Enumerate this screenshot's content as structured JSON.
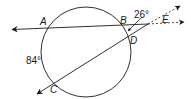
{
  "diagram": {
    "type": "circle-secants",
    "points": {
      "A": "A",
      "B": "B",
      "C": "C",
      "D": "D",
      "E": "E"
    },
    "angles": {
      "arc_BD": "26°",
      "arc_AC": "84°"
    },
    "colors": {
      "stroke": "#1a1a1a",
      "background": "#ffffff"
    }
  }
}
